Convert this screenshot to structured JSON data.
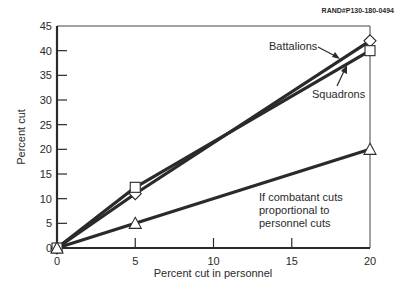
{
  "source_label": "RAND#P130-180-0494",
  "chart_data": {
    "type": "line",
    "title": "",
    "xlabel": "Percent cut in personnel",
    "ylabel": "Percent cut",
    "x": [
      0,
      5,
      20
    ],
    "xlim": [
      0,
      20
    ],
    "ylim": [
      0,
      45
    ],
    "xticks": [
      0,
      5,
      10,
      15,
      20
    ],
    "yticks": [
      0,
      5,
      10,
      15,
      20,
      25,
      30,
      35,
      40,
      45
    ],
    "grid": false,
    "series": [
      {
        "name": "Battalions",
        "marker": "diamond",
        "values": [
          0,
          11,
          42
        ]
      },
      {
        "name": "Squadrons",
        "marker": "square",
        "values": [
          0,
          12.3,
          40
        ]
      },
      {
        "name": "If combatant cuts proportional to personnel cuts",
        "marker": "triangle",
        "values": [
          0,
          5,
          20
        ]
      }
    ],
    "annotations": [
      {
        "text": "Battalions",
        "arrow_to_series": "Battalions"
      },
      {
        "text": "Squadrons",
        "arrow_to_series": "Squadrons"
      },
      {
        "lines": [
          "If combatant cuts",
          "proportional to",
          "personnel cuts"
        ]
      }
    ]
  }
}
